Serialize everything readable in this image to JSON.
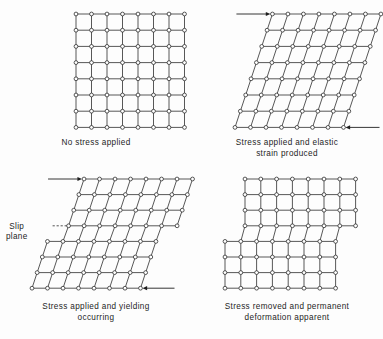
{
  "figure": {
    "background_color": "#fdfdfd",
    "line_color": "#3a3a3a",
    "node_fill": "#ffffff",
    "node_stroke": "#2e2e2e",
    "text_color": "#1d1d1d"
  },
  "panels": [
    {
      "key": "no-stress",
      "caption": "No stress applied",
      "state": "undeformed",
      "grid": {
        "cols": 7,
        "rows": 7,
        "cell_w": 15.5,
        "cell_h": 16.2,
        "origin_x": 76,
        "origin_y": 14
      },
      "shear": 0,
      "arrows": []
    },
    {
      "key": "elastic",
      "caption": "Stress applied and elastic\nstrain produced",
      "state": "elastic-shear",
      "grid": {
        "cols": 7,
        "rows": 7,
        "cell_w": 15.5,
        "cell_h": 16.2,
        "origin_x": 44,
        "origin_y": 14
      },
      "shear": 33,
      "arrows": [
        {
          "name": "top-shear-arrow",
          "direction": "right",
          "position": "top-left"
        },
        {
          "name": "bottom-shear-arrow",
          "direction": "left",
          "position": "bottom-right"
        }
      ]
    },
    {
      "key": "yielding",
      "caption": "Stress applied and yielding\noccurring",
      "state": "yielding-slip",
      "grid": {
        "cols": 7,
        "rows": 7,
        "cell_w": 15.5,
        "cell_h": 15.6,
        "origin_x": 32,
        "origin_y": 10
      },
      "shear": 33,
      "slip_row": 3,
      "slip_offset": 16,
      "label": "Slip\nplane",
      "arrows": [
        {
          "name": "top-shear-arrow",
          "direction": "right",
          "position": "top-left"
        },
        {
          "name": "bottom-shear-arrow",
          "direction": "left",
          "position": "bottom-right"
        }
      ]
    },
    {
      "key": "permanent",
      "caption": "Stress removed and permanent\ndeformation apparent",
      "state": "permanent-step",
      "grid": {
        "cols": 7,
        "rows": 7,
        "cell_w": 15.8,
        "cell_h": 15.6,
        "origin_x": 34,
        "origin_y": 10
      },
      "shear": 0,
      "slip_row": 3,
      "slip_offset": 20,
      "arrows": []
    }
  ]
}
